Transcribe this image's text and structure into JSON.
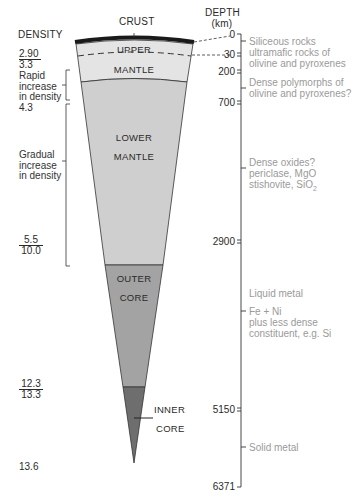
{
  "headers": {
    "density": "DENSITY",
    "depth": "DEPTH",
    "depth_unit": "(km)",
    "crust": "CRUST"
  },
  "layers": {
    "upper": "UPPER",
    "mantle": "MANTLE",
    "lower": "LOWER",
    "lower_mantle": "MANTLE",
    "outer": "OUTER",
    "outer_core": "CORE",
    "inner": "INNER",
    "inner_core": "CORE"
  },
  "density": {
    "d1_top": "2.90",
    "d1_bottom": "3.3",
    "note_rapid": [
      "Rapid",
      "increase",
      "in density"
    ],
    "d2": "4.3",
    "note_gradual": [
      "Gradual",
      "increase",
      "in density"
    ],
    "d3_top": "5.5",
    "d3_bottom": "10.0",
    "d4_top": "12.3",
    "d4_bottom": "13.3",
    "d5": "13.6"
  },
  "depths": [
    "0",
    "30",
    "200",
    "700",
    "2900",
    "5150",
    "6371"
  ],
  "composition": {
    "c1": "Siliceous rocks",
    "c2": [
      "ultramafic rocks of",
      "olivine and pyroxenes"
    ],
    "c3": [
      "Dense polymorphs of",
      "olivine and pyroxenes?"
    ],
    "c4": [
      "Dense oxides?",
      "periclase, MgO",
      "stishovite, SiO"
    ],
    "c4_sub": "2",
    "c5": "Liquid metal",
    "c6": [
      "Fe + Ni",
      "plus less dense",
      "constituent, e.g. Si"
    ],
    "c7": "Solid metal"
  },
  "colors": {
    "crust": "#1a1a1a",
    "upper_mantle": "#e4e4e4",
    "lower_mantle": "#cfcfcf",
    "outer_core": "#a3a3a3",
    "inner_core": "#6e6e6e",
    "composition_text": "#9a9a9a"
  }
}
